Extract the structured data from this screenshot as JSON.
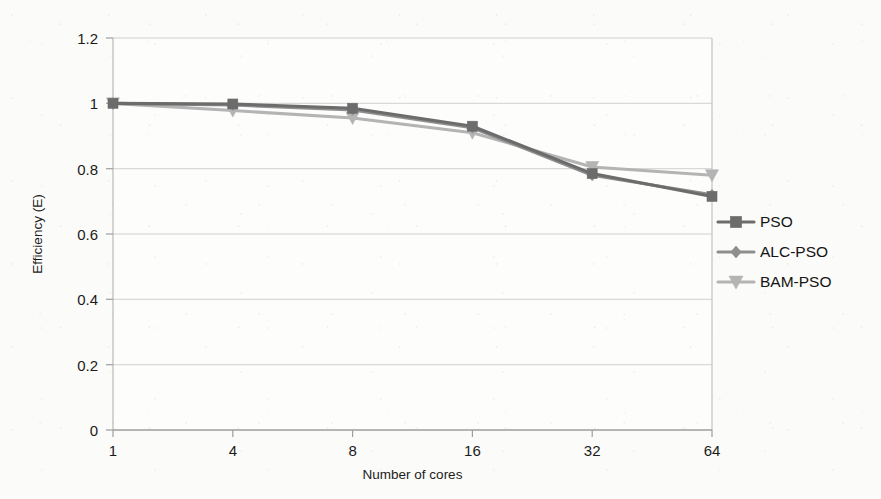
{
  "chart_data": {
    "type": "line",
    "title": "",
    "xlabel": "Number of cores",
    "ylabel": "Efficiency (E)",
    "categories": [
      "1",
      "4",
      "8",
      "16",
      "32",
      "64"
    ],
    "x_tick_labels": [
      "1",
      "4",
      "8",
      "16",
      "32",
      "64"
    ],
    "y_tick_labels": [
      "0",
      "0.2",
      "0.4",
      "0.6",
      "0.8",
      "1",
      "1.2"
    ],
    "y_tick_values": [
      0,
      0.2,
      0.4,
      0.6,
      0.8,
      1,
      1.2
    ],
    "ylim": [
      0,
      1.2
    ],
    "grid": "horizontal",
    "legend_position": "inside-right",
    "series": [
      {
        "name": "PSO",
        "marker": "square",
        "color": "#6c6c6c",
        "values": [
          1.0,
          0.998,
          0.985,
          0.93,
          0.785,
          0.715
        ]
      },
      {
        "name": "ALC-PSO",
        "marker": "diamond",
        "color": "#8e8e8e",
        "values": [
          1.0,
          0.995,
          0.98,
          0.925,
          0.78,
          0.72
        ]
      },
      {
        "name": "BAM-PSO",
        "marker": "triangle-down",
        "color": "#b4b4b4",
        "values": [
          1.0,
          0.978,
          0.955,
          0.91,
          0.805,
          0.78
        ]
      }
    ]
  },
  "colors": {
    "background": "#fbfbf9",
    "plot_border": "#bdbdbd",
    "gridline": "#d0d0d0",
    "text": "#1b1b1b",
    "series_pso": "#6c6c6c",
    "series_alc_pso": "#8e8e8e",
    "series_bam_pso": "#b4b4b4"
  },
  "axes": {
    "y_title": "Efficiency (E)",
    "x_title": "Number of cores",
    "y_labels": {
      "t0": "0",
      "t1": "0.2",
      "t2": "0.4",
      "t3": "0.6",
      "t4": "0.8",
      "t5": "1",
      "t6": "1.2"
    },
    "x_labels": {
      "c0": "1",
      "c1": "4",
      "c2": "8",
      "c3": "16",
      "c4": "32",
      "c5": "64"
    }
  },
  "legend": {
    "items": [
      {
        "label": "PSO",
        "marker": "square",
        "color": "#6c6c6c"
      },
      {
        "label": "ALC-PSO",
        "marker": "diamond",
        "color": "#8e8e8e"
      },
      {
        "label": "BAM-PSO",
        "marker": "triangle-down",
        "color": "#b4b4b4"
      }
    ],
    "item0_label": "PSO",
    "item1_label": "ALC-PSO",
    "item2_label": "BAM-PSO"
  }
}
